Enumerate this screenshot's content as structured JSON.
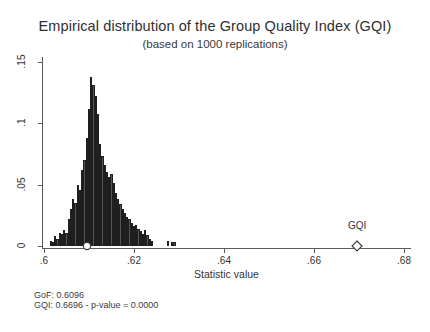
{
  "chart_data": {
    "type": "bar",
    "title": "Empirical distribution of the Group Quality Index (GQI)",
    "subtitle": "(based on 1000 replications)",
    "xlabel": "Statistic value",
    "ylabel": "",
    "xlim": [
      0.5996,
      0.6815
    ],
    "ylim": [
      0,
      0.1555
    ],
    "grid": false,
    "legend": "none",
    "xticks": [
      ".6",
      ".62",
      ".64",
      ".66",
      ".68"
    ],
    "xtick_values": [
      0.6,
      0.62,
      0.64,
      0.66,
      0.68
    ],
    "yticks": [
      "0",
      ".05",
      ".1",
      ".15"
    ],
    "ytick_values": [
      0,
      0.05,
      0.1,
      0.15
    ],
    "bin_width": 0.0005,
    "x": [
      0.6015,
      0.602,
      0.6025,
      0.603,
      0.6035,
      0.604,
      0.6045,
      0.605,
      0.6055,
      0.606,
      0.6065,
      0.607,
      0.6075,
      0.608,
      0.6085,
      0.609,
      0.6095,
      0.61,
      0.6105,
      0.611,
      0.6115,
      0.612,
      0.6125,
      0.613,
      0.6135,
      0.614,
      0.6145,
      0.615,
      0.6155,
      0.616,
      0.6165,
      0.617,
      0.6175,
      0.618,
      0.6185,
      0.619,
      0.6195,
      0.62,
      0.6205,
      0.621,
      0.6215,
      0.622,
      0.6225,
      0.623,
      0.6235,
      0.624,
      0.6275,
      0.6285,
      0.629
    ],
    "values": [
      0.004,
      0.003,
      0.008,
      0.006,
      0.011,
      0.01,
      0.013,
      0.011,
      0.022,
      0.03,
      0.038,
      0.035,
      0.05,
      0.046,
      0.062,
      0.07,
      0.088,
      0.112,
      0.138,
      0.131,
      0.122,
      0.108,
      0.083,
      0.073,
      0.066,
      0.06,
      0.056,
      0.059,
      0.051,
      0.043,
      0.038,
      0.034,
      0.03,
      0.027,
      0.024,
      0.022,
      0.019,
      0.016,
      0.017,
      0.014,
      0.012,
      0.01,
      0.013,
      0.009,
      0.006,
      0.004,
      0.004,
      0.003,
      0.003
    ],
    "markers": [
      {
        "name": "GoF",
        "shape": "circle",
        "x": 0.6096,
        "y": 0,
        "label": "",
        "filled": false
      },
      {
        "name": "GQI",
        "shape": "diamond",
        "x": 0.6696,
        "y": 0,
        "label": "GQI",
        "filled": false
      }
    ],
    "annotations": [
      "GoF: 0.6096",
      "GQI: 0.6696 - p-value = 0.0000"
    ]
  },
  "footnotes": {
    "gof": "GoF: 0.6096",
    "gqi": "GQI: 0.6696 - p-value = 0.0000"
  },
  "colors": {
    "bar_fill": "#555555",
    "bar_edge": "#1f1f1f",
    "axis": "#5a5a5a",
    "text": "#333333",
    "background": "#ffffff"
  }
}
